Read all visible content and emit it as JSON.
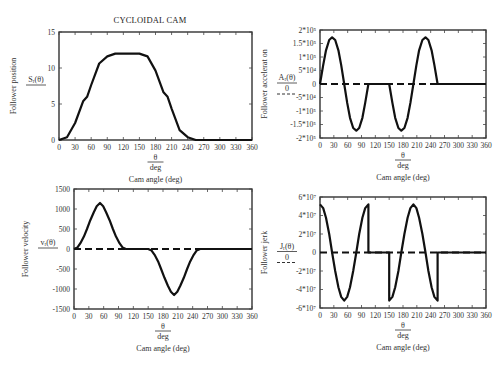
{
  "figure": {
    "title": "CYCLOIDAL CAM"
  },
  "chart_data": [
    {
      "id": "position",
      "type": "line",
      "title": "CYCLOIDAL CAM",
      "xlabel_fraction_num": "θ",
      "xlabel_fraction_den": "deg",
      "xlabel": "Cam angle (deg)",
      "ylabel": "Follower position",
      "ylabel_fraction_num": "S_r(θ)",
      "ylabel_fraction_den": "",
      "xlim": [
        0,
        360
      ],
      "ylim": [
        0,
        15
      ],
      "xticks": [
        "0",
        "30",
        "60",
        "90",
        "120",
        "150",
        "180",
        "210",
        "240",
        "270",
        "300",
        "330",
        "360"
      ],
      "yticks": [
        {
          "v": 0,
          "t": "0"
        },
        {
          "v": 5,
          "t": "5"
        },
        {
          "v": 10,
          "t": "10"
        },
        {
          "v": 15,
          "t": "15"
        }
      ],
      "zero_line": false,
      "box": [
        59,
        32,
        252,
        140
      ],
      "x": [
        0,
        15,
        30,
        45,
        52.5,
        60,
        75,
        90,
        105,
        120,
        135,
        150,
        165,
        180,
        195,
        202.5,
        210,
        225,
        240,
        255,
        270,
        300,
        330,
        360
      ],
      "values": [
        0,
        0.39,
        2.36,
        5.38,
        6.0,
        7.64,
        10.62,
        11.61,
        12,
        12,
        12,
        12,
        11.61,
        9.64,
        6.62,
        6.0,
        4.36,
        1.38,
        0.39,
        0,
        0,
        0,
        0,
        0
      ]
    },
    {
      "id": "acceleration",
      "type": "line",
      "xlabel_fraction_num": "θ",
      "xlabel_fraction_den": "deg",
      "xlabel": "Cam angle (deg)",
      "ylabel": "Follower accelerat on",
      "ylabel_fraction_num": "A_r(θ)",
      "ylabel_fraction_den": "0",
      "xlim": [
        0,
        360
      ],
      "ylim": [
        -200000,
        200000
      ],
      "xticks": [
        "0",
        "30",
        "60",
        "90",
        "120",
        "150",
        "180",
        "210",
        "240",
        "270",
        "300",
        "330",
        "360"
      ],
      "yticks": [
        {
          "v": 200000,
          "t": "2*10⁵"
        },
        {
          "v": 150000,
          "t": "1.5*10⁵"
        },
        {
          "v": 100000,
          "t": "1*10⁵"
        },
        {
          "v": 50000,
          "t": "5*10⁴"
        },
        {
          "v": 0,
          "t": "0"
        },
        {
          "v": -50000,
          "t": "-5*10⁴"
        },
        {
          "v": -100000,
          "t": "-1*10⁵"
        },
        {
          "v": -150000,
          "t": "-1.5*10⁵"
        },
        {
          "v": -200000,
          "t": "-2*10⁵"
        }
      ],
      "zero_line": true,
      "box": [
        320,
        30,
        486,
        138
      ],
      "x": [
        0,
        7,
        13,
        20,
        26.25,
        33,
        40,
        46,
        52.5,
        59,
        65,
        72,
        78.75,
        85,
        92,
        98,
        105,
        150,
        157,
        163,
        170,
        176.25,
        183,
        190,
        196,
        202.5,
        209,
        215,
        222,
        228.75,
        235,
        242,
        248,
        255,
        360
      ],
      "values": [
        0,
        70000,
        125000,
        163000,
        173000,
        163000,
        125000,
        70000,
        0,
        -70000,
        -125000,
        -163000,
        -173000,
        -163000,
        -125000,
        -70000,
        0,
        0,
        -70000,
        -125000,
        -163000,
        -173000,
        -163000,
        -125000,
        -70000,
        0,
        70000,
        125000,
        163000,
        173000,
        163000,
        125000,
        70000,
        0,
        0
      ]
    },
    {
      "id": "velocity",
      "type": "line",
      "xlabel_fraction_num": "θ",
      "xlabel_fraction_den": "deg",
      "xlabel": "Cam angle (deg)",
      "ylabel": "Follower velocity",
      "ylabel_fraction_num": "v_r(θ)",
      "ylabel_fraction_den": "",
      "xlim": [
        0,
        360
      ],
      "ylim": [
        -1500,
        1500
      ],
      "xticks": [
        "0",
        "30",
        "60",
        "90",
        "120",
        "150",
        "180",
        "210",
        "240",
        "270",
        "300",
        "330",
        "360"
      ],
      "yticks": [
        {
          "v": 1500,
          "t": "1500"
        },
        {
          "v": 1000,
          "t": "1000"
        },
        {
          "v": 500,
          "t": "500"
        },
        {
          "v": 0,
          "t": "0"
        },
        {
          "v": -500,
          "t": "-500"
        },
        {
          "v": -1000,
          "t": "-1000"
        },
        {
          "v": -1500,
          "t": "-1500"
        }
      ],
      "zero_line": true,
      "box": [
        74,
        189,
        252,
        309
      ],
      "x": [
        0,
        7,
        13,
        20,
        26.25,
        33,
        40,
        46,
        52.5,
        59,
        65,
        72,
        78.75,
        85,
        92,
        98,
        105,
        150,
        157,
        163,
        170,
        176.25,
        183,
        190,
        196,
        202.5,
        209,
        215,
        222,
        228.75,
        235,
        242,
        248,
        255,
        360
      ],
      "values": [
        0,
        40,
        145,
        310,
        500,
        720,
        920,
        1070,
        1150,
        1070,
        920,
        720,
        500,
        310,
        145,
        40,
        0,
        0,
        -40,
        -145,
        -310,
        -500,
        -720,
        -920,
        -1070,
        -1150,
        -1070,
        -920,
        -720,
        -500,
        -310,
        -145,
        -40,
        0,
        0
      ]
    },
    {
      "id": "jerk",
      "type": "line",
      "xlabel_fraction_num": "θ",
      "xlabel_fraction_den": "deg",
      "xlabel": "Cam angle (deg)",
      "ylabel": "Follower jerk",
      "ylabel_fraction_num": "J_r(θ)",
      "ylabel_fraction_den": "0",
      "xlim": [
        0,
        360
      ],
      "ylim": [
        -60000000,
        60000000
      ],
      "xticks": [
        "0",
        "30",
        "60",
        "90",
        "120",
        "150",
        "180",
        "210",
        "240",
        "270",
        "300",
        "330",
        "360"
      ],
      "yticks": [
        {
          "v": 60000000,
          "t": "6*10⁷"
        },
        {
          "v": 40000000,
          "t": "4*10⁷"
        },
        {
          "v": 20000000,
          "t": "2*10⁷"
        },
        {
          "v": 0,
          "t": "0"
        },
        {
          "v": -20000000,
          "t": "-2*10⁷"
        },
        {
          "v": -40000000,
          "t": "-4*10⁷"
        },
        {
          "v": -60000000,
          "t": "-6*10⁷"
        }
      ],
      "zero_line": true,
      "box": [
        320,
        197,
        486,
        308
      ],
      "x": [
        0,
        7,
        13,
        20,
        26.25,
        33,
        40,
        46,
        52.5,
        59,
        65,
        72,
        78.75,
        85,
        92,
        98,
        105,
        105.01,
        150,
        150.01,
        157,
        163,
        170,
        176.25,
        183,
        190,
        196,
        202.5,
        209,
        215,
        222,
        228.75,
        235,
        242,
        248,
        255,
        255.01,
        360
      ],
      "values": [
        52000000,
        48000000,
        37500000,
        20000000,
        0,
        -20000000,
        -37500000,
        -48000000,
        -52000000,
        -48000000,
        -37500000,
        -20000000,
        0,
        20000000,
        37500000,
        48000000,
        52000000,
        0,
        0,
        -52000000,
        -48000000,
        -37500000,
        -20000000,
        0,
        20000000,
        37500000,
        48000000,
        52000000,
        48000000,
        37500000,
        20000000,
        0,
        -20000000,
        -37500000,
        -48000000,
        -52000000,
        0,
        0
      ]
    }
  ]
}
